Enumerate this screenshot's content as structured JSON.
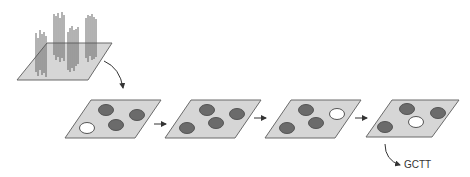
{
  "diagram": {
    "colors": {
      "plate_fill": "#d6d6d6",
      "plate_stroke": "#6a6a6a",
      "spot_dark": "#6b6b6b",
      "spot_light": "#ffffff",
      "strands": "#555555",
      "arrow": "#333333"
    },
    "source_plate": {
      "name": "cluster-plate",
      "strand_groups": 4
    },
    "cycles": [
      {
        "index": 1,
        "spots": [
          "dark",
          "dark",
          "dark",
          "light"
        ]
      },
      {
        "index": 2,
        "spots": [
          "dark",
          "dark",
          "dark",
          "dark"
        ]
      },
      {
        "index": 3,
        "spots": [
          "dark",
          "light",
          "dark",
          "dark"
        ]
      },
      {
        "index": 4,
        "spots": [
          "dark",
          "dark",
          "light",
          "dark"
        ]
      }
    ],
    "output_label": "GCTT"
  }
}
